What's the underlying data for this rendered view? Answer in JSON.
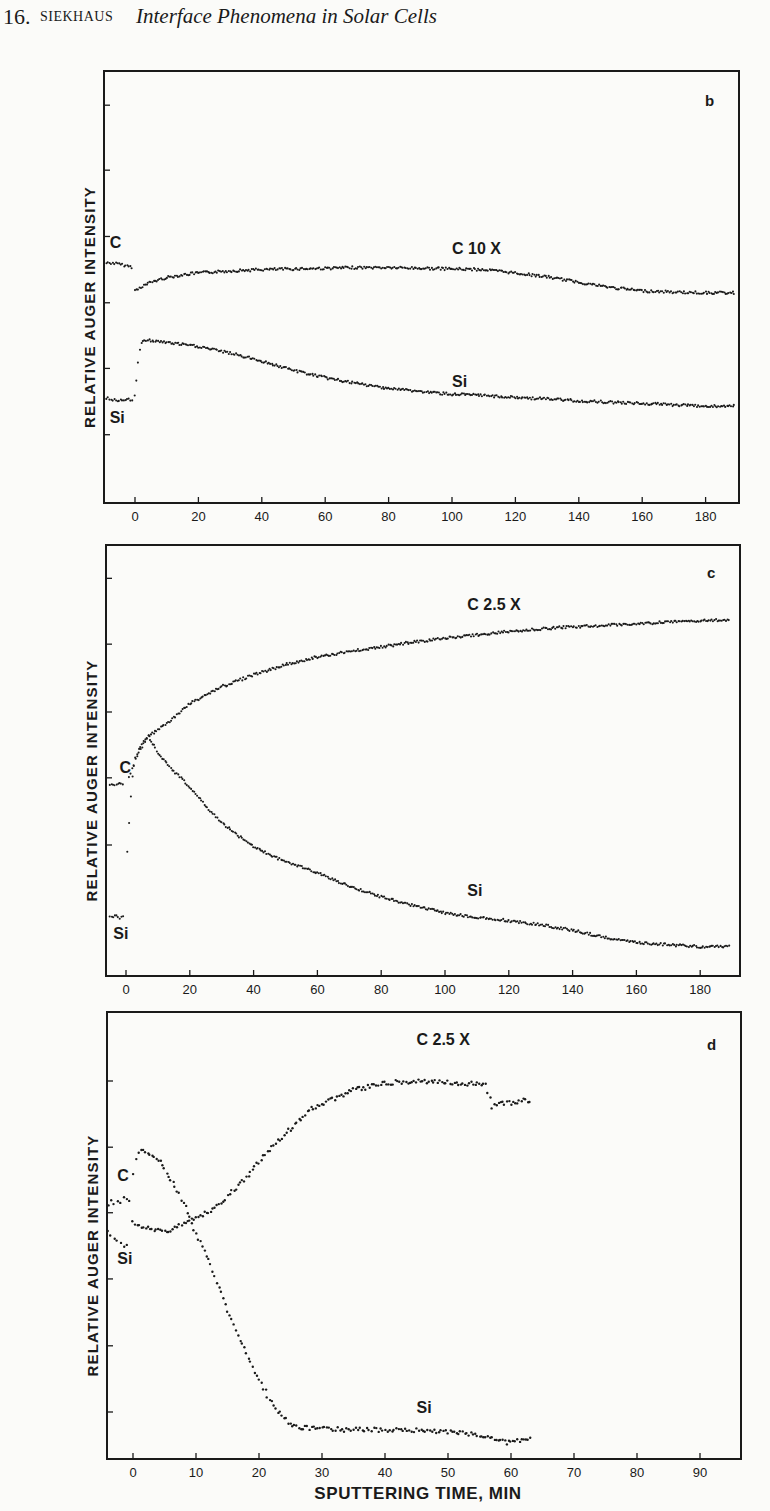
{
  "header": {
    "chapter_number": "16.",
    "author": "SIEKHAUS",
    "title": "Interface Phenomena in Solar Cells"
  },
  "chart_data": [
    {
      "type": "scatter",
      "panel": "b",
      "title": "b",
      "xlabel": "",
      "ylabel": "RELATIVE AUGER INTENSITY",
      "x_ticks": [
        0,
        20,
        40,
        60,
        80,
        100,
        120,
        140,
        160,
        180
      ],
      "xlim": [
        -10,
        190
      ],
      "ylim": [
        0,
        6.5
      ],
      "y_ticks_unlabeled": [
        1.03,
        2.03,
        3.02,
        4.02,
        5.02,
        6.0
      ],
      "grid": false,
      "annotations": [
        {
          "text": "C",
          "x": -8,
          "y": 3.85
        },
        {
          "text": "C  10 X",
          "x": 100,
          "y": 3.75
        },
        {
          "text": "Si",
          "x": 100,
          "y": 1.75
        },
        {
          "text": "Si",
          "x": -8,
          "y": 1.2
        }
      ],
      "series": [
        {
          "name": "C 10X (reference, pre-sputter)",
          "x": [
            -9,
            -7,
            -5,
            -3,
            -1
          ],
          "y": [
            3.62,
            3.62,
            3.6,
            3.58,
            3.56
          ]
        },
        {
          "name": "C 10X",
          "x": [
            0,
            2,
            5,
            10,
            15,
            20,
            30,
            40,
            50,
            60,
            70,
            80,
            90,
            100,
            110,
            120,
            130,
            140,
            150,
            160,
            170,
            180,
            189
          ],
          "y": [
            3.2,
            3.26,
            3.33,
            3.4,
            3.44,
            3.47,
            3.5,
            3.52,
            3.53,
            3.54,
            3.55,
            3.55,
            3.54,
            3.53,
            3.52,
            3.47,
            3.41,
            3.33,
            3.25,
            3.2,
            3.18,
            3.17,
            3.17
          ]
        },
        {
          "name": "Si (reference, pre-sputter)",
          "x": [
            -9,
            -7,
            -5,
            -3,
            -1
          ],
          "y": [
            1.58,
            1.56,
            1.55,
            1.55,
            1.56
          ]
        },
        {
          "name": "Si",
          "x": [
            0,
            0.5,
            1,
            1.5,
            2,
            3,
            5,
            10,
            20,
            30,
            40,
            50,
            60,
            70,
            80,
            90,
            100,
            110,
            120,
            130,
            140,
            150,
            160,
            170,
            180,
            189
          ],
          "y": [
            1.62,
            1.85,
            2.1,
            2.3,
            2.4,
            2.46,
            2.45,
            2.42,
            2.36,
            2.26,
            2.14,
            2.0,
            1.89,
            1.8,
            1.73,
            1.68,
            1.64,
            1.62,
            1.59,
            1.57,
            1.54,
            1.52,
            1.5,
            1.48,
            1.46,
            1.46
          ]
        }
      ]
    },
    {
      "type": "scatter",
      "panel": "c",
      "title": "c",
      "xlabel": "",
      "ylabel": "RELATIVE AUGER INTENSITY",
      "x_ticks": [
        0,
        20,
        40,
        60,
        80,
        100,
        120,
        140,
        160,
        180
      ],
      "xlim": [
        -6,
        193
      ],
      "ylim": [
        0,
        6.45
      ],
      "y_ticks_unlabeled": [
        1.97,
        2.98,
        3.97,
        4.99,
        5.98
      ],
      "grid": false,
      "annotations": [
        {
          "text": "C",
          "x": -2,
          "y": 3.05
        },
        {
          "text": "C   2.5 X",
          "x": 107,
          "y": 5.5
        },
        {
          "text": "Si",
          "x": 107,
          "y": 1.2
        },
        {
          "text": "Si",
          "x": -4,
          "y": 0.55
        }
      ],
      "series": [
        {
          "name": "C 2.5X (reference, pre-sputter)",
          "x": [
            -5,
            -4,
            -3,
            -2,
            -1
          ],
          "y": [
            2.86,
            2.88,
            2.87,
            2.9,
            2.88
          ]
        },
        {
          "name": "C 2.5X",
          "x": [
            1,
            2,
            3,
            5,
            7,
            10,
            15,
            20,
            30,
            40,
            50,
            60,
            70,
            80,
            90,
            100,
            110,
            120,
            130,
            140,
            150,
            160,
            170,
            180,
            189
          ],
          "y": [
            3.0,
            3.12,
            3.25,
            3.45,
            3.6,
            3.7,
            3.88,
            4.1,
            4.35,
            4.53,
            4.68,
            4.8,
            4.88,
            4.95,
            5.02,
            5.08,
            5.13,
            5.18,
            5.22,
            5.25,
            5.27,
            5.3,
            5.32,
            5.34,
            5.36
          ]
        },
        {
          "name": "Si (reference, pre-sputter)",
          "x": [
            -5,
            -4,
            -3,
            -2,
            -1
          ],
          "y": [
            0.9,
            0.89,
            0.91,
            0.88,
            0.89
          ]
        },
        {
          "name": "Si",
          "x": [
            0.5,
            1,
            1.5,
            2,
            3,
            5,
            7,
            10,
            15,
            20,
            25,
            30,
            40,
            50,
            60,
            70,
            80,
            90,
            100,
            110,
            120,
            130,
            140,
            150,
            160,
            170,
            180,
            189
          ],
          "y": [
            1.86,
            2.3,
            2.7,
            3.0,
            3.3,
            3.5,
            3.6,
            3.36,
            3.08,
            2.84,
            2.56,
            2.3,
            1.94,
            1.72,
            1.55,
            1.35,
            1.19,
            1.06,
            0.95,
            0.88,
            0.83,
            0.77,
            0.69,
            0.58,
            0.5,
            0.47,
            0.44,
            0.44
          ]
        }
      ]
    },
    {
      "type": "scatter",
      "panel": "d",
      "title": "d",
      "xlabel": "SPUTTERING TIME, MIN",
      "ylabel": "RELATIVE AUGER INTENSITY",
      "x_ticks": [
        0,
        10,
        20,
        30,
        40,
        50,
        60,
        70,
        80,
        90
      ],
      "xlim": [
        -4.1,
        96.5
      ],
      "ylim": [
        0,
        6.75
      ],
      "y_ticks_unlabeled": [
        0.71,
        1.71,
        2.72,
        3.72,
        4.71,
        5.71
      ],
      "grid": false,
      "annotations": [
        {
          "text": "C",
          "x": -2.5,
          "y": 4.2
        },
        {
          "text": "C   2.5 X",
          "x": 45,
          "y": 6.25
        },
        {
          "text": "Si",
          "x": 45,
          "y": 0.7
        },
        {
          "text": "Si",
          "x": -2.5,
          "y": 2.95
        }
      ],
      "series": [
        {
          "name": "C 2.5X (reference, pre-sputter)",
          "x": [
            -4,
            -3.5,
            -3,
            -2.5,
            -2,
            -1.5,
            -1,
            -0.5
          ],
          "y": [
            3.8,
            3.92,
            3.86,
            3.9,
            3.84,
            3.95,
            3.9,
            3.93
          ]
        },
        {
          "name": "C 2.5X",
          "x": [
            0,
            1,
            2,
            3,
            4,
            5,
            6,
            7,
            8,
            9,
            10,
            12,
            14,
            16,
            18,
            20,
            22,
            24,
            26,
            28,
            30,
            32,
            35,
            38,
            40,
            43,
            46,
            48,
            50,
            52,
            54,
            56,
            57,
            58,
            60,
            62,
            63
          ],
          "y": [
            3.61,
            3.5,
            3.48,
            3.47,
            3.46,
            3.44,
            3.47,
            3.5,
            3.55,
            3.6,
            3.66,
            3.74,
            3.87,
            4.06,
            4.26,
            4.48,
            4.71,
            4.9,
            5.08,
            5.27,
            5.36,
            5.45,
            5.57,
            5.63,
            5.68,
            5.7,
            5.71,
            5.7,
            5.7,
            5.66,
            5.67,
            5.66,
            5.32,
            5.36,
            5.38,
            5.42,
            5.42
          ]
        },
        {
          "name": "Si (reference, pre-sputter)",
          "x": [
            -4,
            -3.5,
            -3,
            -2.5,
            -2,
            -1.5,
            -1
          ],
          "y": [
            3.45,
            3.41,
            3.33,
            3.3,
            3.24,
            3.2,
            3.23
          ]
        },
        {
          "name": "Si",
          "x": [
            0,
            0.5,
            1,
            2,
            3,
            4,
            5,
            6,
            7,
            8,
            9,
            10,
            11,
            12,
            13,
            14,
            15,
            16,
            17,
            18,
            19,
            20,
            21,
            22,
            23,
            24,
            25,
            26,
            28,
            30,
            35,
            40,
            45,
            50,
            52,
            55,
            57,
            58,
            59,
            60,
            61,
            62,
            63
          ],
          "y": [
            4.32,
            4.55,
            4.64,
            4.64,
            4.58,
            4.52,
            4.4,
            4.21,
            4.05,
            3.87,
            3.65,
            3.41,
            3.2,
            3.0,
            2.75,
            2.5,
            2.25,
            2.0,
            1.8,
            1.6,
            1.4,
            1.19,
            1.02,
            0.85,
            0.72,
            0.62,
            0.54,
            0.49,
            0.47,
            0.46,
            0.44,
            0.44,
            0.43,
            0.41,
            0.39,
            0.36,
            0.33,
            0.28,
            0.25,
            0.26,
            0.27,
            0.28,
            0.31
          ]
        }
      ]
    }
  ],
  "layout": {
    "panels": [
      {
        "left": 104,
        "right": 739,
        "top": 71,
        "bottom": 503,
        "x0_px": 135,
        "px_per_min": 3.17,
        "px_per_unit": 66.3,
        "letter_x": 705,
        "letter_y": 106
      },
      {
        "left": 106,
        "right": 740,
        "top": 545,
        "bottom": 976,
        "x0_px": 126,
        "px_per_min": 3.19,
        "px_per_unit": 66.5,
        "letter_x": 707,
        "letter_y": 578
      },
      {
        "left": 107,
        "right": 741,
        "top": 1012,
        "bottom": 1459,
        "x0_px": 133,
        "px_per_min": 6.3,
        "px_per_unit": 66.2,
        "letter_x": 707,
        "letter_y": 1050
      }
    ],
    "ink_color": "#1a1a1a",
    "paper_color": "#fbfbf9"
  }
}
